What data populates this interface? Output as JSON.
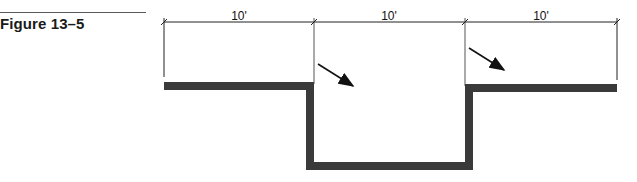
{
  "figure": {
    "label": "Figure 13–5"
  },
  "dimensions": [
    {
      "label": "10'",
      "x1": 164,
      "x2": 314
    },
    {
      "label": "10'",
      "x1": 314,
      "x2": 465
    },
    {
      "label": "10'",
      "x1": 465,
      "x2": 617
    }
  ],
  "colors": {
    "profile": "#3a3a3a",
    "lines": "#222222"
  }
}
